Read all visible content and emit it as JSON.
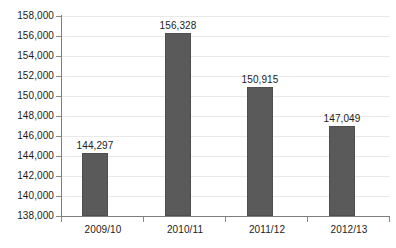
{
  "chart_data": {
    "type": "bar",
    "title": "",
    "subtitle": "",
    "xlabel": "",
    "ylabel": "",
    "categories": [
      "2009/10",
      "2010/11",
      "2011/12",
      "2012/13"
    ],
    "values": [
      144297,
      156328,
      150915,
      147049
    ],
    "value_labels": [
      "144,297",
      "156,328",
      "150,915",
      "147,049"
    ],
    "ylim": [
      138000,
      158000
    ],
    "ytick_step": 2000,
    "ytick_labels": [
      "158,000",
      "156,000",
      "154,000",
      "152,000",
      "150,000",
      "148,000",
      "146,000",
      "144,000",
      "142,000",
      "140,000",
      "138,000"
    ],
    "ytick_values": [
      158000,
      156000,
      154000,
      152000,
      150000,
      148000,
      146000,
      144000,
      142000,
      140000,
      138000
    ],
    "grid": true,
    "legend": false,
    "legend_position": "none",
    "series": [
      {
        "name": "",
        "values": [
          144297,
          156328,
          150915,
          147049
        ]
      }
    ],
    "colors": {
      "bar_fill": "#5a5a5a",
      "bar_stroke": "#4e4e4e",
      "gridline": "#e9e9e9",
      "axis": "#7d7d7d",
      "text": "#1c1c1c",
      "background": "#ffffff"
    }
  }
}
